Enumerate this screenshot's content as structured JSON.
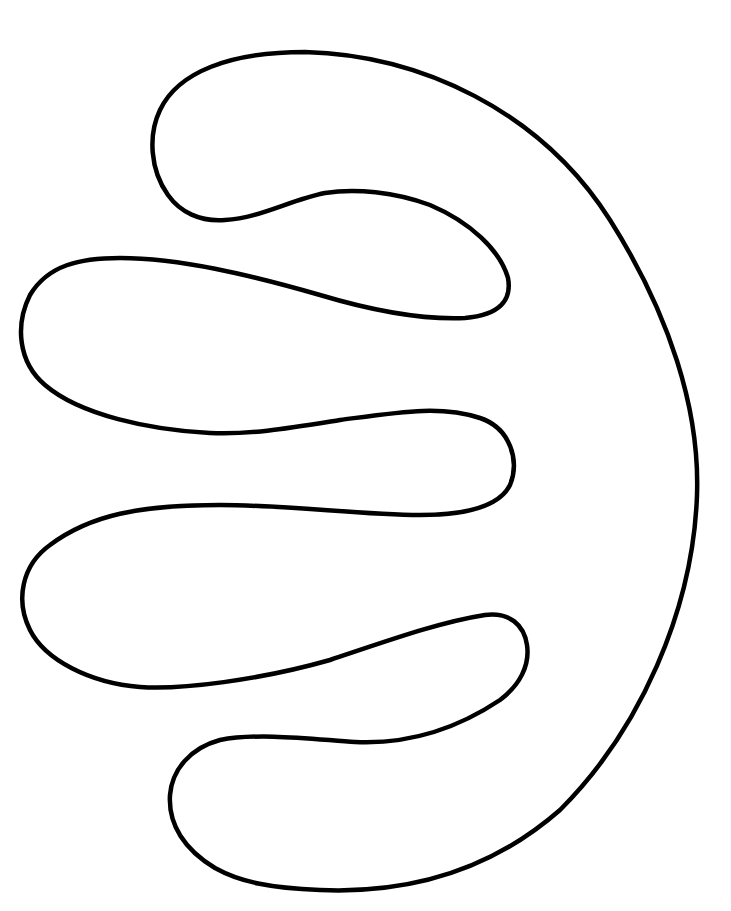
{
  "drawing": {
    "description": "Line art outline of a rounded shape with three finger-like lobes extending left",
    "stroke_color": "#000000",
    "background_color": "#ffffff",
    "stroke_width": 4.5
  }
}
